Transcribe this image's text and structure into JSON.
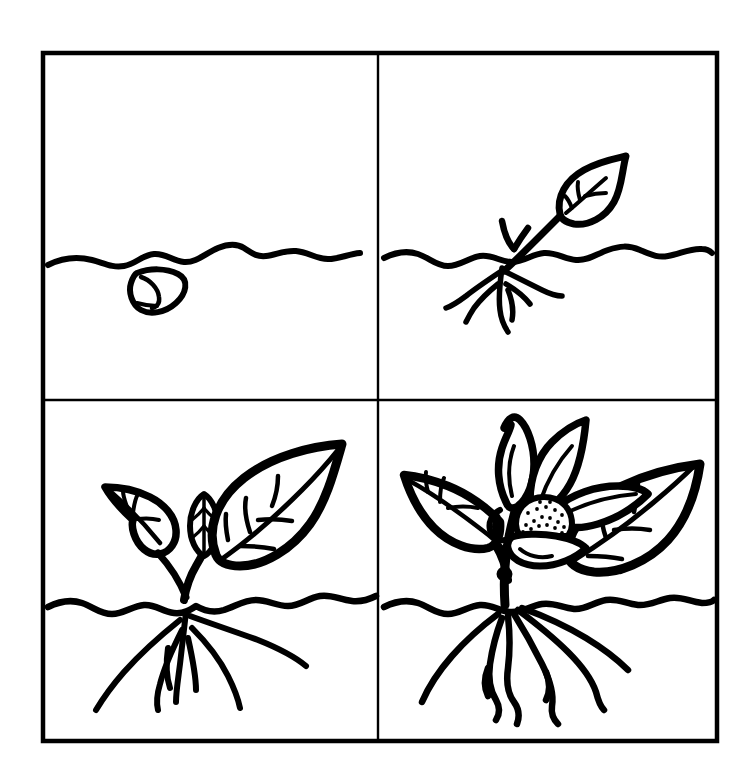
{
  "document": {
    "title": "Plant Life Cycle",
    "subject": "Four-stage plant growth sequence line drawing",
    "style": "black ink outline coloring page",
    "background_color": "#ffffff",
    "ink_color": "#000000",
    "canvas": {
      "width": 755,
      "height": 784
    }
  },
  "frame": {
    "outer": {
      "x": 43,
      "y": 53,
      "width": 674,
      "height": 688,
      "stroke_width": 4
    },
    "divider_vertical_x": 378,
    "divider_horizontal_y": 400,
    "divider_stroke_width": 2,
    "panel_count": 4,
    "layout": "2x2 grid"
  },
  "panels": [
    {
      "id": "panel-1",
      "position": "top-left",
      "stage_number": 1,
      "stage_name": "Seed",
      "description": "A single seed resting just below the wavy soil line",
      "soil_line_y": 255,
      "has_soil_line": true,
      "elements": [
        "soil-line",
        "seed"
      ],
      "leaf_count": 0,
      "root_count": 0
    },
    {
      "id": "panel-2",
      "position": "top-right",
      "stage_number": 2,
      "stage_name": "Sprout",
      "description": "Germinated seedling with one leaf above ground and first roots below",
      "soil_line_y": 255,
      "has_soil_line": true,
      "elements": [
        "soil-line",
        "stem",
        "leaf",
        "side-shoot",
        "roots"
      ],
      "leaf_count": 1,
      "root_count": 5
    },
    {
      "id": "panel-3",
      "position": "bottom-left",
      "stage_number": 3,
      "stage_name": "Young plant",
      "description": "Growing plant with large leaf, smaller leaf, central bud and a spreading root system",
      "soil_line_y": 608,
      "has_soil_line": true,
      "elements": [
        "soil-line",
        "stem",
        "large-leaf",
        "small-leaf",
        "center-bud",
        "roots"
      ],
      "leaf_count": 3,
      "root_count": 5
    },
    {
      "id": "panel-4",
      "position": "bottom-right",
      "stage_number": 4,
      "stage_name": "Flowering plant",
      "description": "Mature plant with many leaves, petals and a stippled seed head above deep wavy roots",
      "soil_line_y": 608,
      "has_soil_line": true,
      "elements": [
        "soil-line",
        "stem",
        "leaves",
        "petals",
        "stippled-flower-head",
        "roots"
      ],
      "leaf_count": 6,
      "root_count": 6,
      "flower_stipple_dots": 22
    }
  ],
  "colors": {
    "ink": "#000000",
    "paper": "#ffffff"
  }
}
